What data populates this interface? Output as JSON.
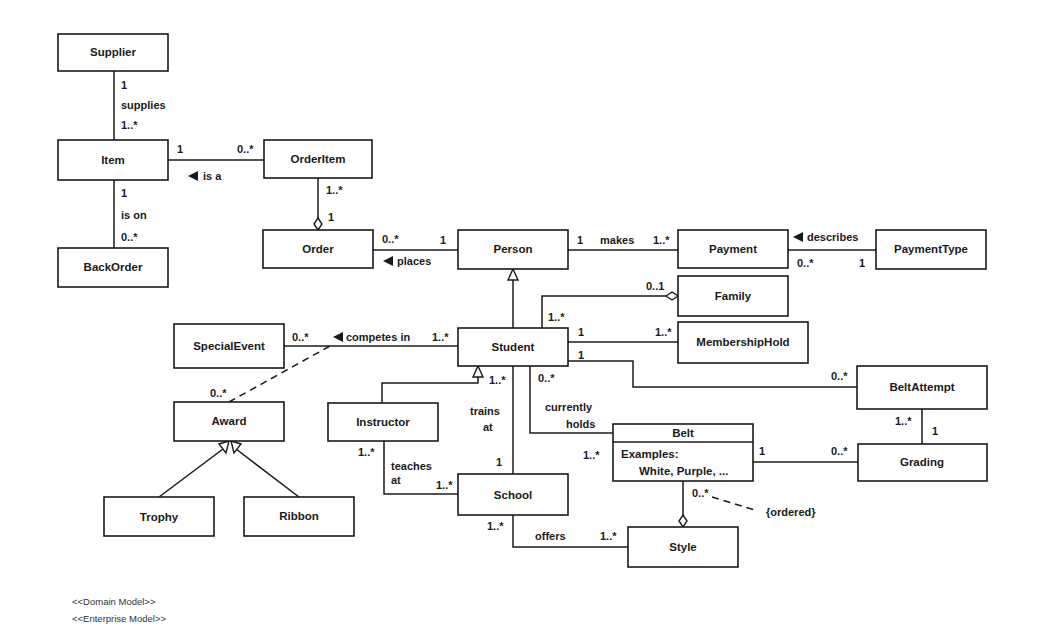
{
  "diagram": {
    "type": "UML class diagram",
    "classes": {
      "supplier": "Supplier",
      "item": "Item",
      "backorder": "BackOrder",
      "orderitem": "OrderItem",
      "order": "Order",
      "person": "Person",
      "payment": "Payment",
      "paymenttype": "PaymentType",
      "family": "Family",
      "membershiphold": "MembershipHold",
      "specialevent": "SpecialEvent",
      "student": "Student",
      "award": "Award",
      "trophy": "Trophy",
      "ribbon": "Ribbon",
      "instructor": "Instructor",
      "school": "School",
      "belt": "Belt",
      "belt_attr1": "Examples:",
      "belt_attr2": "White, Purple, ...",
      "beltattempt": "BeltAttempt",
      "grading": "Grading",
      "style": "Style"
    },
    "associations": {
      "supplies": {
        "name": "supplies",
        "m1": "1",
        "m2": "1..*"
      },
      "isa": {
        "name": "is a",
        "m1": "1",
        "m2": "0..*"
      },
      "ison": {
        "name": "is on",
        "m1": "1",
        "m2": "0..*"
      },
      "orderitem_order": {
        "m1": "1..*",
        "m2": "1"
      },
      "places": {
        "name": "places",
        "m1": "0..*",
        "m2": "1"
      },
      "makes": {
        "name": "makes",
        "m1": "1",
        "m2": "1..*"
      },
      "describes": {
        "name": "describes",
        "m1": "0..*",
        "m2": "1"
      },
      "family": {
        "m1": "1..*",
        "m2": "0..1"
      },
      "membership": {
        "m1": "1",
        "m2": "1..*"
      },
      "competes": {
        "name": "competes in",
        "m1": "0..*",
        "m2": "1..*"
      },
      "award": {
        "m1": "0..*"
      },
      "beltattempt": {
        "m1": "1",
        "m2": "0..*"
      },
      "trains": {
        "name1": "trains",
        "name2": "at",
        "m1": "1..*",
        "m2": "1"
      },
      "holds": {
        "name1": "currently",
        "name2": "holds",
        "m1": "0..*",
        "m2": "1..*"
      },
      "teaches": {
        "name1": "teaches",
        "name2": "at",
        "m1": "1..*",
        "m2": "1..*"
      },
      "offers": {
        "name": "offers",
        "m1": "1..*",
        "m2": "1..*"
      },
      "belt_grading": {
        "m1": "1",
        "m2": "0..*"
      },
      "attempt_grading": {
        "m1": "1..*",
        "m2": "1"
      },
      "belt_style": {
        "m1": "0..*",
        "constraint": "{ordered}"
      }
    }
  },
  "footer": {
    "stereotype1": "<<Domain Model>>",
    "stereotype2": "<<Enterprise Model>>"
  }
}
